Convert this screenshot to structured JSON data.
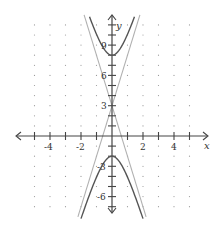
{
  "chart_data": {
    "type": "line",
    "title": "",
    "xlabel": "x",
    "ylabel": "y",
    "xlim": [
      -6.2,
      6.2
    ],
    "ylim": [
      -7.6,
      12
    ],
    "x_ticks": [
      -5,
      -4,
      -3,
      -2,
      -1,
      1,
      2,
      3,
      4,
      5
    ],
    "x_tick_labels": [
      {
        "value": -4,
        "label": "-4"
      },
      {
        "value": -2,
        "label": "-2"
      },
      {
        "value": 2,
        "label": "2"
      },
      {
        "value": 4,
        "label": "4"
      }
    ],
    "y_ticks": [
      -7,
      -6,
      -5,
      -4,
      -3,
      -2,
      -1,
      1,
      2,
      3,
      4,
      5,
      6,
      7,
      8,
      9,
      10,
      11
    ],
    "y_tick_labels": [
      {
        "value": 9,
        "label": "9"
      },
      {
        "value": 6,
        "label": "6"
      },
      {
        "value": 3,
        "label": "3"
      },
      {
        "value": -3,
        "label": "-3"
      },
      {
        "value": -6,
        "label": "-6"
      }
    ],
    "grid": "dotted",
    "equation": "(y-3)^2/25 - x^2 = 1",
    "series": [
      {
        "name": "hyperbola upper branch",
        "style": "solid",
        "color": "#555555",
        "vertex": [
          0,
          8
        ],
        "points": [
          [
            -1.2,
            10.8
          ],
          [
            -0.8,
            9.4
          ],
          [
            -0.4,
            8.4
          ],
          [
            0,
            8
          ],
          [
            0.4,
            8.4
          ],
          [
            0.8,
            9.4
          ],
          [
            1.2,
            10.8
          ]
        ]
      },
      {
        "name": "hyperbola lower branch",
        "style": "solid",
        "color": "#555555",
        "vertex": [
          0,
          -2
        ],
        "points": [
          [
            -2.1,
            -8.6
          ],
          [
            -1.5,
            -6.0
          ],
          [
            -1.0,
            -4.1
          ],
          [
            -0.5,
            -2.6
          ],
          [
            0,
            -2
          ],
          [
            0.5,
            -2.6
          ],
          [
            1.0,
            -4.1
          ],
          [
            1.5,
            -6.0
          ],
          [
            2.1,
            -8.6
          ]
        ]
      },
      {
        "name": "asymptote y = 3 + 5x",
        "style": "solid",
        "color": "#aaaaaa",
        "points": [
          [
            -2.2,
            -8
          ],
          [
            1.8,
            12
          ]
        ]
      },
      {
        "name": "asymptote y = 3 - 5x",
        "style": "solid",
        "color": "#aaaaaa",
        "points": [
          [
            -1.8,
            12
          ],
          [
            2.2,
            -8
          ]
        ]
      }
    ],
    "center": [
      0,
      3
    ],
    "colors": {
      "axis": "#444444",
      "curve": "#555555",
      "asymptote": "#b0b0b0",
      "grid_dot": "#9a9a9a",
      "background": "#ffffff"
    }
  },
  "labels": {
    "x_axis": "x",
    "y_axis": "y",
    "x_neg4": "-4",
    "x_neg2": "-2",
    "x_2": "2",
    "x_4": "4",
    "y_9": "9",
    "y_6": "6",
    "y_3": "3",
    "y_neg3": "-3",
    "y_neg6": "-6"
  }
}
